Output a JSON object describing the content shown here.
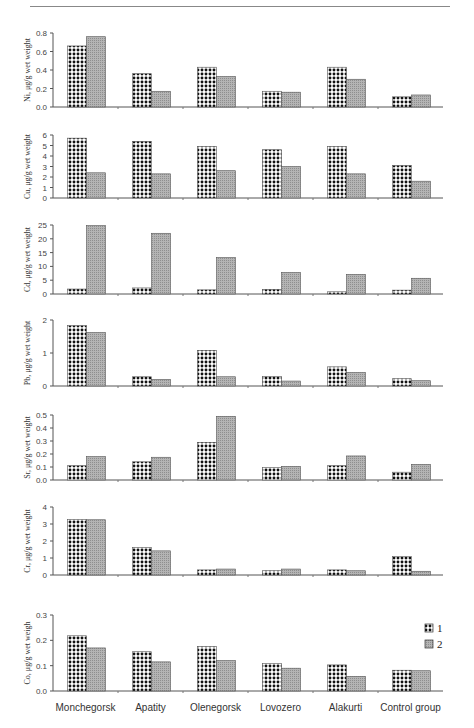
{
  "chart_data": {
    "type": "bar",
    "layout": "vertically stacked small multiples sharing x categories",
    "categories": [
      "Monchegorsk",
      "Apatity",
      "Olenegorsk",
      "Lovozero",
      "Alakurti",
      "Control group"
    ],
    "legend": {
      "position": "upper right of bottom panel",
      "entries": [
        "1",
        "2"
      ]
    },
    "series_styles": {
      "1": {
        "pattern": "black dots on white (checker)",
        "color": "#111111"
      },
      "2": {
        "pattern": "grey stipple",
        "color": "#a8a8a8"
      }
    },
    "grid": false,
    "panels": [
      {
        "element": "Ni",
        "ylabel": "Ni, μg/g wet weight",
        "ylim": [
          0,
          0.8
        ],
        "yticks": [
          "0.0",
          "0.2",
          "0.4",
          "0.6",
          "0.8"
        ],
        "series": [
          {
            "name": "1",
            "values": [
              0.66,
              0.36,
              0.43,
              0.17,
              0.43,
              0.11
            ]
          },
          {
            "name": "2",
            "values": [
              0.76,
              0.17,
              0.33,
              0.16,
              0.3,
              0.13
            ]
          }
        ]
      },
      {
        "element": "Cu",
        "ylabel": "Cu, μg/g wet weight",
        "ylim": [
          0,
          6
        ],
        "yticks": [
          "0",
          "1",
          "2",
          "3",
          "4",
          "5",
          "6"
        ],
        "series": [
          {
            "name": "1",
            "values": [
              5.7,
              5.4,
              4.9,
              4.6,
              4.9,
              3.1
            ]
          },
          {
            "name": "2",
            "values": [
              2.4,
              2.3,
              2.6,
              3.0,
              2.3,
              1.6
            ]
          }
        ]
      },
      {
        "element": "Cd",
        "ylabel": "Cd, μg/g wet weight",
        "ylim": [
          0,
          25
        ],
        "yticks": [
          "0",
          "5",
          "10",
          "15",
          "20",
          "25"
        ],
        "series": [
          {
            "name": "1",
            "values": [
              1.8,
              2.2,
              1.5,
              1.7,
              0.8,
              1.4
            ]
          },
          {
            "name": "2",
            "values": [
              24.8,
              22.0,
              13.2,
              7.8,
              7.1,
              5.7
            ]
          }
        ]
      },
      {
        "element": "Pb",
        "ylabel": "Pb, μg/g wet weight",
        "ylim": [
          0,
          2
        ],
        "yticks": [
          "0",
          "1",
          "2"
        ],
        "series": [
          {
            "name": "1",
            "values": [
              1.83,
              0.28,
              1.08,
              0.29,
              0.58,
              0.22
            ]
          },
          {
            "name": "2",
            "values": [
              1.62,
              0.2,
              0.28,
              0.15,
              0.41,
              0.16
            ]
          }
        ]
      },
      {
        "element": "Sr",
        "ylabel": "Sr, μg/g wet weight",
        "ylim": [
          0,
          0.5
        ],
        "yticks": [
          "0.0",
          "0.1",
          "0.2",
          "0.3",
          "0.4",
          "0.5"
        ],
        "series": [
          {
            "name": "1",
            "values": [
              0.11,
              0.14,
              0.29,
              0.095,
              0.11,
              0.06
            ]
          },
          {
            "name": "2",
            "values": [
              0.18,
              0.175,
              0.49,
              0.105,
              0.185,
              0.12
            ]
          }
        ]
      },
      {
        "element": "Cr",
        "ylabel": "Cr, μg/g wet weight",
        "ylim": [
          0,
          4
        ],
        "yticks": [
          "0",
          "1",
          "2",
          "3",
          "4"
        ],
        "series": [
          {
            "name": "1",
            "values": [
              3.27,
              1.62,
              0.3,
              0.25,
              0.3,
              1.08
            ]
          },
          {
            "name": "2",
            "values": [
              3.25,
              1.42,
              0.35,
              0.35,
              0.25,
              0.22
            ]
          }
        ]
      },
      {
        "element": "Co",
        "ylabel": "Co, μg/g wet weigh",
        "ylim": [
          0,
          0.3
        ],
        "yticks": [
          "0.0",
          "0.1",
          "0.2",
          "0.3"
        ],
        "series": [
          {
            "name": "1",
            "values": [
              0.218,
              0.155,
              0.175,
              0.108,
              0.103,
              0.082
            ]
          },
          {
            "name": "2",
            "values": [
              0.17,
              0.115,
              0.12,
              0.09,
              0.058,
              0.08
            ]
          }
        ]
      }
    ]
  }
}
